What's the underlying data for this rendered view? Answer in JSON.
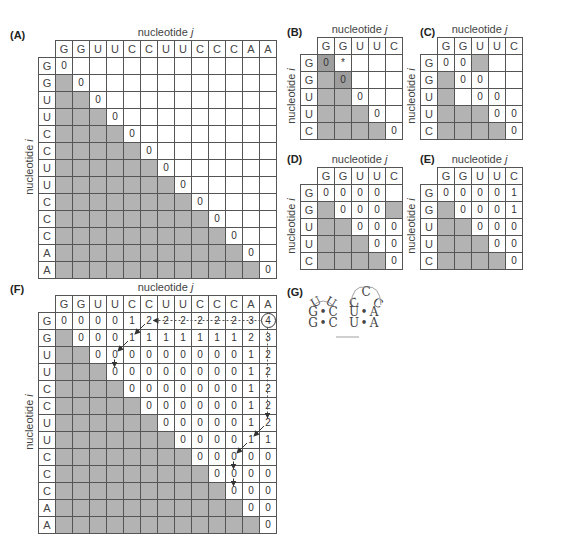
{
  "axis_label_prefix": "nucleotide",
  "axis_j": "j",
  "axis_i": "i",
  "panels": {
    "A": {
      "label": "(A)",
      "cols": [
        "G",
        "G",
        "U",
        "U",
        "C",
        "C",
        "U",
        "U",
        "C",
        "C",
        "C",
        "A",
        "A"
      ],
      "rows": [
        "G",
        "G",
        "U",
        "U",
        "C",
        "C",
        "U",
        "U",
        "C",
        "C",
        "C",
        "A",
        "A"
      ],
      "cells": [
        [
          "0",
          "",
          "",
          "",
          "",
          "",
          "",
          "",
          "",
          "",
          "",
          "",
          ""
        ],
        [
          "#",
          "0",
          "",
          "",
          "",
          "",
          "",
          "",
          "",
          "",
          "",
          "",
          ""
        ],
        [
          "#",
          "#",
          "0",
          "",
          "",
          "",
          "",
          "",
          "",
          "",
          "",
          "",
          ""
        ],
        [
          "#",
          "#",
          "#",
          "0",
          "",
          "",
          "",
          "",
          "",
          "",
          "",
          "",
          ""
        ],
        [
          "#",
          "#",
          "#",
          "#",
          "0",
          "",
          "",
          "",
          "",
          "",
          "",
          "",
          ""
        ],
        [
          "#",
          "#",
          "#",
          "#",
          "#",
          "0",
          "",
          "",
          "",
          "",
          "",
          "",
          ""
        ],
        [
          "#",
          "#",
          "#",
          "#",
          "#",
          "#",
          "0",
          "",
          "",
          "",
          "",
          "",
          ""
        ],
        [
          "#",
          "#",
          "#",
          "#",
          "#",
          "#",
          "#",
          "0",
          "",
          "",
          "",
          "",
          ""
        ],
        [
          "#",
          "#",
          "#",
          "#",
          "#",
          "#",
          "#",
          "#",
          "0",
          "",
          "",
          "",
          ""
        ],
        [
          "#",
          "#",
          "#",
          "#",
          "#",
          "#",
          "#",
          "#",
          "#",
          "0",
          "",
          "",
          ""
        ],
        [
          "#",
          "#",
          "#",
          "#",
          "#",
          "#",
          "#",
          "#",
          "#",
          "#",
          "0",
          "",
          ""
        ],
        [
          "#",
          "#",
          "#",
          "#",
          "#",
          "#",
          "#",
          "#",
          "#",
          "#",
          "#",
          "0",
          ""
        ],
        [
          "#",
          "#",
          "#",
          "#",
          "#",
          "#",
          "#",
          "#",
          "#",
          "#",
          "#",
          "#",
          "0"
        ]
      ]
    },
    "B": {
      "label": "(B)",
      "cols": [
        "G",
        "G",
        "U",
        "U",
        "C"
      ],
      "rows": [
        "G",
        "G",
        "U",
        "U",
        "C"
      ],
      "cells": [
        [
          "D0",
          "*",
          "",
          "",
          ""
        ],
        [
          "#",
          "D0",
          "",
          "",
          ""
        ],
        [
          "#",
          "#",
          "0",
          "",
          ""
        ],
        [
          "#",
          "#",
          "#",
          "0",
          ""
        ],
        [
          "#",
          "#",
          "#",
          "#",
          "0"
        ]
      ]
    },
    "C": {
      "label": "(C)",
      "cols": [
        "G",
        "G",
        "U",
        "U",
        "C"
      ],
      "rows": [
        "G",
        "G",
        "U",
        "U",
        "C"
      ],
      "cells": [
        [
          "0",
          "0",
          "#",
          "",
          ""
        ],
        [
          "#",
          "0",
          "0",
          "",
          ""
        ],
        [
          "#",
          "",
          "0",
          "0",
          ""
        ],
        [
          "#",
          "#",
          "#",
          "0",
          "0"
        ],
        [
          "#",
          "#",
          "#",
          "#",
          "0"
        ]
      ]
    },
    "D": {
      "label": "(D)",
      "cols": [
        "G",
        "G",
        "U",
        "U",
        "C"
      ],
      "rows": [
        "G",
        "G",
        "U",
        "U",
        "C"
      ],
      "cells": [
        [
          "0",
          "0",
          "0",
          "0",
          ""
        ],
        [
          "#",
          "0",
          "0",
          "0",
          "#"
        ],
        [
          "#",
          "#",
          "0",
          "0",
          "0"
        ],
        [
          "#",
          "#",
          "#",
          "0",
          "0"
        ],
        [
          "#",
          "#",
          "#",
          "#",
          "0"
        ]
      ]
    },
    "E": {
      "label": "(E)",
      "cols": [
        "G",
        "G",
        "U",
        "U",
        "C"
      ],
      "rows": [
        "G",
        "G",
        "U",
        "U",
        "C"
      ],
      "cells": [
        [
          "0",
          "0",
          "0",
          "0",
          "1"
        ],
        [
          "#",
          "0",
          "0",
          "0",
          "1"
        ],
        [
          "#",
          "#",
          "0",
          "0",
          "0"
        ],
        [
          "#",
          "#",
          "#",
          "0",
          "0"
        ],
        [
          "#",
          "#",
          "#",
          "#",
          "0"
        ]
      ]
    },
    "F": {
      "label": "(F)",
      "cols": [
        "G",
        "G",
        "U",
        "U",
        "C",
        "C",
        "U",
        "U",
        "C",
        "C",
        "C",
        "A",
        "A"
      ],
      "rows": [
        "G",
        "G",
        "U",
        "U",
        "C",
        "C",
        "U",
        "U",
        "C",
        "C",
        "C",
        "A",
        "A"
      ],
      "circled_cell": [
        0,
        12
      ],
      "cells": [
        [
          "0",
          "0",
          "0",
          "0",
          "1",
          "2",
          "2",
          "2",
          "2",
          "2",
          "2",
          "3",
          "4"
        ],
        [
          "#",
          "0",
          "0",
          "0",
          "1",
          "1",
          "1",
          "1",
          "1",
          "1",
          "1",
          "2",
          "3"
        ],
        [
          "#",
          "#",
          "0",
          "0",
          "0",
          "0",
          "0",
          "0",
          "0",
          "0",
          "0",
          "1",
          "2"
        ],
        [
          "#",
          "#",
          "#",
          "0",
          "0",
          "0",
          "0",
          "0",
          "0",
          "0",
          "0",
          "1",
          "2"
        ],
        [
          "#",
          "#",
          "#",
          "#",
          "0",
          "0",
          "0",
          "0",
          "0",
          "0",
          "0",
          "1",
          "2"
        ],
        [
          "#",
          "#",
          "#",
          "#",
          "#",
          "0",
          "0",
          "0",
          "0",
          "0",
          "0",
          "1",
          "2"
        ],
        [
          "#",
          "#",
          "#",
          "#",
          "#",
          "#",
          "0",
          "0",
          "0",
          "0",
          "0",
          "1",
          "2"
        ],
        [
          "#",
          "#",
          "#",
          "#",
          "#",
          "#",
          "#",
          "0",
          "0",
          "0",
          "0",
          "1",
          "1"
        ],
        [
          "#",
          "#",
          "#",
          "#",
          "#",
          "#",
          "#",
          "#",
          "0",
          "0",
          "0",
          "0",
          "0"
        ],
        [
          "#",
          "#",
          "#",
          "#",
          "#",
          "#",
          "#",
          "#",
          "#",
          "0",
          "0",
          "0",
          "0"
        ],
        [
          "#",
          "#",
          "#",
          "#",
          "#",
          "#",
          "#",
          "#",
          "#",
          "#",
          "0",
          "0",
          "0"
        ],
        [
          "#",
          "#",
          "#",
          "#",
          "#",
          "#",
          "#",
          "#",
          "#",
          "#",
          "#",
          "0",
          "0"
        ],
        [
          "#",
          "#",
          "#",
          "#",
          "#",
          "#",
          "#",
          "#",
          "#",
          "#",
          "#",
          "#",
          "0"
        ]
      ],
      "traceback": {
        "dotted": [
          [
            [
              0,
              12
            ],
            [
              0,
              5
            ]
          ],
          [
            [
              0,
              12
            ],
            [
              6,
              12
            ]
          ]
        ],
        "arrows": [
          [
            [
              0,
              5
            ],
            [
              1,
              4
            ]
          ],
          [
            [
              1,
              4
            ],
            [
              2,
              3
            ]
          ],
          [
            [
              2,
              3
            ],
            [
              3,
              3
            ]
          ],
          [
            [
              6,
              12
            ],
            [
              7,
              11
            ]
          ],
          [
            [
              7,
              11
            ],
            [
              8,
              10
            ]
          ],
          [
            [
              8,
              10
            ],
            [
              9,
              10
            ]
          ],
          [
            [
              9,
              10
            ],
            [
              10,
              10
            ]
          ]
        ]
      }
    },
    "G": {
      "label": "(G)",
      "hairpin_left": {
        "loop": [
          "U",
          "U"
        ],
        "pairs": [
          [
            "G",
            "C"
          ],
          [
            "G",
            "C"
          ]
        ]
      },
      "hairpin_right": {
        "loop": [
          "C",
          "C",
          "C"
        ],
        "pairs": [
          [
            "U",
            "A"
          ],
          [
            "U",
            "A"
          ]
        ]
      },
      "pair_symbol": "•"
    }
  }
}
